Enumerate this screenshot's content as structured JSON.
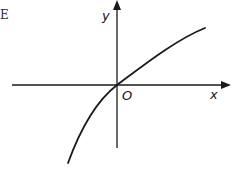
{
  "option_label": "E",
  "axes": {
    "x_label": "x",
    "y_label": "y",
    "origin_label": "O"
  },
  "curve": {
    "description": "increasing concave-down curve passing through the origin, steep in third quadrant, flattening in first quadrant",
    "color": "#1a1a1a"
  },
  "colors": {
    "background": "#ffffff",
    "ink": "#1a1a1a"
  }
}
